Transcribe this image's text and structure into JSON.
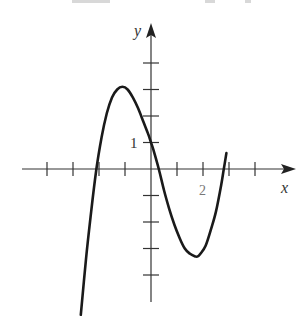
{
  "chart_data": {
    "type": "line",
    "title": "",
    "xlabel": "x",
    "ylabel": "y",
    "xlim": [
      -4,
      5
    ],
    "ylim": [
      -5,
      5
    ],
    "grid": false,
    "legend": null,
    "annotations": [
      {
        "text": "1",
        "at": "y-axis tick y=1"
      },
      {
        "text": "2",
        "at": "x-axis tick x=2"
      }
    ],
    "x_ticks": [
      -4,
      -3,
      -2,
      -1,
      1,
      2,
      3,
      4
    ],
    "y_ticks": [
      -4,
      -3,
      -2,
      -1,
      1,
      2,
      3,
      4
    ],
    "x_tick_labels": {
      "2": "2"
    },
    "y_tick_labels": {
      "1": "1"
    },
    "series": [
      {
        "name": "f(x)",
        "description": "Cubic polynomial with roots near x=-2.1, x=0.3, x=2.8; local max about (-1.1, 3); local min about (1.8, -3); y-intercept 1",
        "x": [
          -2.7,
          -2.5,
          -2.3,
          -2.1,
          -1.9,
          -1.7,
          -1.5,
          -1.3,
          -1.1,
          -0.9,
          -0.7,
          -0.5,
          -0.3,
          -0.1,
          0.0,
          0.1,
          0.3,
          0.5,
          0.7,
          0.9,
          1.1,
          1.3,
          1.5,
          1.7,
          1.8,
          1.9,
          2.1,
          2.3,
          2.5,
          2.7,
          2.8,
          2.9
        ],
        "y": [
          -5.5,
          -3.4,
          -1.6,
          0.0,
          1.2,
          2.1,
          2.7,
          3.0,
          3.1,
          3.0,
          2.7,
          2.3,
          1.8,
          1.3,
          1.0,
          0.7,
          0.0,
          -0.8,
          -1.5,
          -2.1,
          -2.6,
          -3.0,
          -3.2,
          -3.3,
          -3.3,
          -3.2,
          -2.9,
          -2.3,
          -1.6,
          -0.6,
          0.0,
          0.6
        ]
      }
    ]
  },
  "axes": {
    "x_label": "x",
    "y_label": "y",
    "y_tick_label": "1",
    "x_tick_label": "2"
  }
}
